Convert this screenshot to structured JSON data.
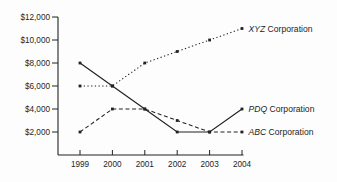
{
  "chart_data": {
    "type": "line",
    "x": [
      1999,
      2000,
      2001,
      2002,
      2003,
      2004
    ],
    "x_tick_labels": [
      "1999",
      "2000",
      "2001",
      "2002",
      "2003",
      "2004"
    ],
    "y_ticks": [
      2000,
      4000,
      6000,
      8000,
      10000,
      12000
    ],
    "y_tick_labels": [
      "$2,000",
      "$4,000",
      "$6,000",
      "$8,000",
      "$10,000",
      "$12,000"
    ],
    "ylim": [
      0,
      12000
    ],
    "xlabel": "",
    "ylabel": "",
    "title": "",
    "grid": false,
    "legend_position": "line-end-labels",
    "marker": "square",
    "series": [
      {
        "abbr": "XYZ",
        "suffix": " Corporation",
        "name": "XYZ Corporation",
        "style": "dotted",
        "values": [
          6000,
          6000,
          8000,
          9000,
          10000,
          11000
        ]
      },
      {
        "abbr": "PDQ",
        "suffix": " Corporation",
        "name": "PDQ Corporation",
        "style": "solid",
        "values": [
          8000,
          6000,
          4000,
          2000,
          2000,
          4000
        ]
      },
      {
        "abbr": "ABC",
        "suffix": " Corporation",
        "name": "ABC Corporation",
        "style": "dashed",
        "values": [
          2000,
          4000,
          4000,
          3000,
          2000,
          2000
        ]
      }
    ],
    "colors": {
      "line": "#222222",
      "text": "#1d1d1d",
      "background": "#fdfdfd"
    }
  }
}
